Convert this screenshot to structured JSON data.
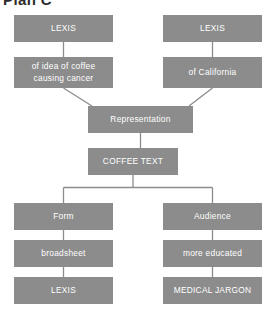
{
  "title": "Plan C",
  "colors": {
    "node_fill": "#8c8c8c",
    "node_text": "#ffffff",
    "connector": "#8c8c8c",
    "background": "#ffffff",
    "title_text": "#2b2b2b"
  },
  "diagram": {
    "type": "flowchart",
    "nodes": [
      {
        "id": "lexis-left",
        "label": "LEXIS"
      },
      {
        "id": "idea",
        "label": "of idea of coffee causing cancer"
      },
      {
        "id": "lexis-right",
        "label": "LEXIS"
      },
      {
        "id": "california",
        "label": "of California"
      },
      {
        "id": "representation",
        "label": "Representation"
      },
      {
        "id": "coffee-text",
        "label": "COFFEE TEXT"
      },
      {
        "id": "form",
        "label": "Form"
      },
      {
        "id": "broadsheet",
        "label": "broadsheet"
      },
      {
        "id": "lexis-bottom",
        "label": "LEXIS"
      },
      {
        "id": "audience",
        "label": "Audience"
      },
      {
        "id": "more-educated",
        "label": "more educated"
      },
      {
        "id": "medical",
        "label": "MEDICAL JARGON"
      }
    ],
    "edges": [
      {
        "from": "lexis-left",
        "to": "idea"
      },
      {
        "from": "lexis-right",
        "to": "california"
      },
      {
        "from": "idea",
        "to": "representation"
      },
      {
        "from": "california",
        "to": "representation"
      },
      {
        "from": "representation",
        "to": "coffee-text"
      },
      {
        "from": "coffee-text",
        "to": "form"
      },
      {
        "from": "coffee-text",
        "to": "audience"
      },
      {
        "from": "form",
        "to": "broadsheet"
      },
      {
        "from": "broadsheet",
        "to": "lexis-bottom"
      },
      {
        "from": "audience",
        "to": "more-educated"
      },
      {
        "from": "more-educated",
        "to": "medical"
      }
    ]
  }
}
